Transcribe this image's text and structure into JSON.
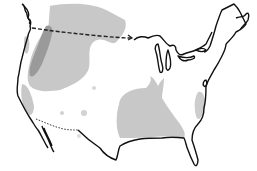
{
  "map": {
    "subject": "United States range map",
    "colors": {
      "background": "#ffffff",
      "outline": "#111111",
      "range_light": "#c8c8c8",
      "range_dark": "#9a9a9a",
      "border_dashed": "#222222"
    },
    "regions": [
      {
        "name": "northern-plains-range",
        "shade": "light"
      },
      {
        "name": "northern-rockies-core-range",
        "shade": "dark"
      },
      {
        "name": "pacific-northwest-range",
        "shade": "light"
      },
      {
        "name": "southeast-range",
        "shade": "light"
      },
      {
        "name": "east-coast-range",
        "shade": "light"
      }
    ],
    "boundaries": [
      {
        "name": "us-canada-border",
        "style": "dashed"
      },
      {
        "name": "us-mexico-border",
        "style": "dotted"
      }
    ]
  }
}
